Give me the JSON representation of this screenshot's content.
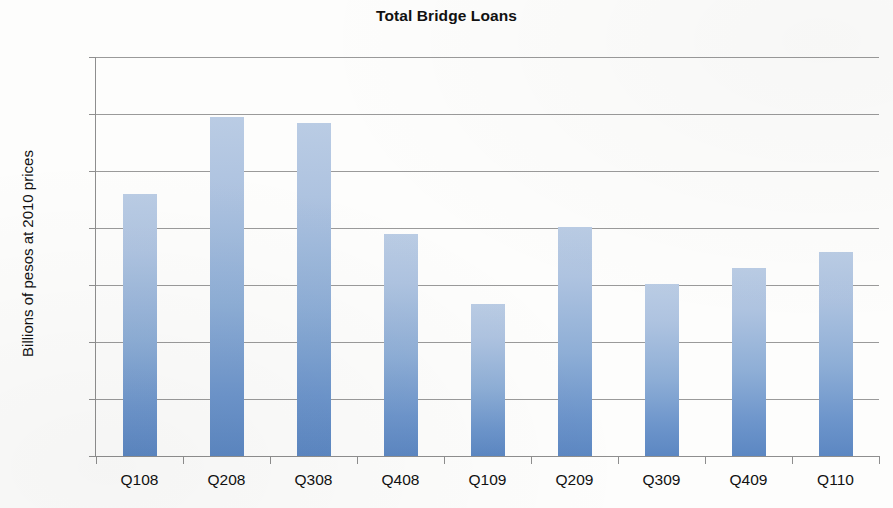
{
  "chart_data": {
    "type": "bar",
    "title": "Total Bridge Loans",
    "xlabel": "",
    "ylabel": "Billions of pesos at 2010 prices",
    "categories": [
      "Q108",
      "Q208",
      "Q308",
      "Q408",
      "Q109",
      "Q209",
      "Q309",
      "Q409",
      "Q110"
    ],
    "values": [
      9.2,
      11.9,
      11.7,
      7.8,
      5.35,
      8.05,
      6.05,
      6.6,
      7.15
    ],
    "ylim": [
      0,
      14
    ],
    "ytick_labels": [
      "0",
      "2",
      "4",
      "6",
      "8",
      "10",
      "12",
      "14"
    ],
    "ytick_values": [
      0,
      2,
      4,
      6,
      8,
      10,
      12,
      14
    ],
    "grid": "horizontal",
    "legend": "none",
    "series": [
      {
        "name": "Total Bridge Loans",
        "values": [
          9.2,
          11.9,
          11.7,
          7.8,
          5.35,
          8.05,
          6.05,
          6.6,
          7.15
        ]
      }
    ],
    "colors": {
      "bar_top": "#bacce4",
      "bar_bottom": "#5c87c2",
      "gridline": "#9a9a9a",
      "axis": "#8e8e8e",
      "text": "#111111",
      "background": "#fdfdfc"
    }
  }
}
